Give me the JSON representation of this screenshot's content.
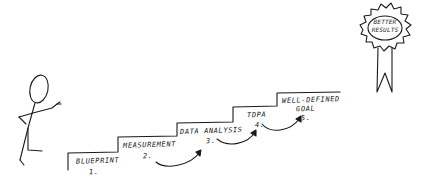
{
  "diagram": {
    "type": "hand-drawn staircase sketch",
    "stroke_color": "#1a1a1a",
    "background": "#ffffff",
    "figure": {
      "label": "stick figure pointing at stairs"
    },
    "steps": [
      {
        "name": "BLUEPRINT",
        "number": "1."
      },
      {
        "name": "MEASUREMENT",
        "number": "2."
      },
      {
        "name": "DATA ANALYSIS",
        "number": "3."
      },
      {
        "name": "TDPA",
        "number": "4."
      },
      {
        "name": "WELL-DEFINED",
        "name_line2": "GOAL",
        "number": "5."
      }
    ],
    "arrows": [
      {
        "from": "2.",
        "to": "3."
      },
      {
        "from": "3.",
        "to": "4."
      },
      {
        "from": "4.",
        "to": "5."
      }
    ],
    "award": {
      "line1": "BETTER",
      "line2": "RESULTS",
      "shape": "rosette ribbon"
    }
  }
}
